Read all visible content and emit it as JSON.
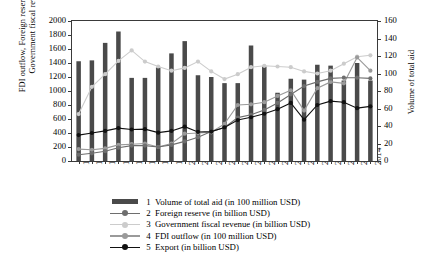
{
  "axes": {
    "y_left_title": "FDI outflow, Foreign reserve, Export, Government fiscal revenue",
    "y_left_title_line1": "FDI outflow, Foreign reserve, Export,",
    "y_left_title_line2": "Government fiscal revenue",
    "y_right_title": "Volume of total aid"
  },
  "legend": {
    "items": [
      {
        "num": "1",
        "label": "Volume of total aid (in 100 million USD)",
        "key": "bar",
        "color": "#4a4a4a"
      },
      {
        "num": "2",
        "label": "Foreign reserve (in billion USD)",
        "key": "line",
        "color": "#6e6e6e"
      },
      {
        "num": "3",
        "label": "Government fiscal revenue (in billion USD)",
        "key": "line",
        "color": "#cccccc"
      },
      {
        "num": "4",
        "label": "FDI outflow (in 100 million USD)",
        "key": "line",
        "color": "#9a9a9a"
      },
      {
        "num": "5",
        "label": "Export (in billion USD)",
        "key": "line",
        "color": "#111111"
      }
    ]
  },
  "chart_data": {
    "type": "bar",
    "title": "",
    "xlabel": "",
    "ylabel": "FDI outflow, Foreign reserve, Export, Government fiscal revenue",
    "y2label": "Volume of total aid",
    "ylim": [
      0,
      2000
    ],
    "y2lim": [
      0,
      160
    ],
    "yticks": [
      0,
      200,
      400,
      600,
      800,
      1000,
      1200,
      1400,
      1600,
      1800,
      2000
    ],
    "y2ticks": [
      0,
      20,
      40,
      60,
      80,
      100,
      120,
      140,
      160
    ],
    "grid": false,
    "legend_position": "bottom",
    "categories": [
      "1992",
      "1993",
      "1994",
      "1995",
      "1996",
      "1997",
      "1998",
      "1999",
      "2000",
      "2001",
      "2002",
      "2003",
      "2004",
      "2005",
      "2006",
      "2007",
      "2008",
      "2009",
      "2010",
      "2011",
      "2012",
      "2013",
      "2014"
    ],
    "series": [
      {
        "name": "Volume of total aid (in 100 million USD)",
        "kind": "bar",
        "axis": "right",
        "color": "#4a4a4a",
        "values": [
          114,
          115,
          135,
          148,
          95,
          95,
          107,
          123,
          137,
          98,
          96,
          89,
          89,
          132,
          108,
          78,
          94,
          93,
          110,
          109,
          92,
          112,
          92
        ]
      },
      {
        "name": "Foreign reserve (in billion USD)",
        "kind": "line",
        "axis": "left",
        "color": "#6e6e6e",
        "values": [
          90,
          110,
          140,
          190,
          220,
          220,
          200,
          230,
          280,
          340,
          420,
          480,
          620,
          660,
          730,
          830,
          950,
          1070,
          1130,
          1180,
          1190,
          1190,
          1180
        ]
      },
      {
        "name": "Government fiscal revenue (in billion USD)",
        "kind": "line",
        "axis": "left",
        "color": "#cccccc",
        "values": [
          670,
          1060,
          1240,
          1430,
          1580,
          1420,
          1350,
          1290,
          1330,
          1420,
          1280,
          1170,
          1240,
          1340,
          1360,
          1350,
          1340,
          1280,
          1250,
          1290,
          1390,
          1490,
          1510
        ]
      },
      {
        "name": "FDI outflow (in 100 million USD)",
        "kind": "line",
        "axis": "left",
        "color": "#9a9a9a",
        "values": [
          170,
          160,
          180,
          230,
          240,
          250,
          200,
          250,
          390,
          400,
          410,
          530,
          800,
          810,
          840,
          930,
          1010,
          720,
          1040,
          1130,
          1110,
          1480,
          1290
        ]
      },
      {
        "name": "Export (in billion USD)",
        "kind": "line",
        "axis": "left",
        "color": "#111111",
        "values": [
          370,
          400,
          430,
          470,
          450,
          455,
          405,
          430,
          490,
          415,
          420,
          480,
          585,
          625,
          675,
          740,
          830,
          590,
          800,
          855,
          840,
          755,
          780
        ]
      }
    ]
  }
}
